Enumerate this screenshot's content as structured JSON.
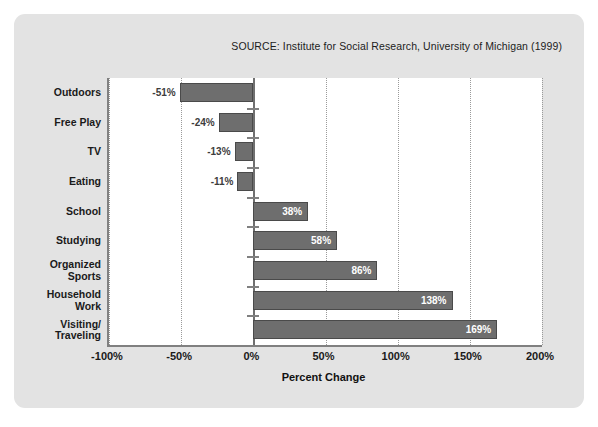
{
  "source_note": "SOURCE: Institute for Social Research, University of Michigan (1999)",
  "axis": {
    "xlabel": "Percent Change",
    "ticks": [
      "-100%",
      "-50%",
      "0%",
      "50%",
      "100%",
      "150%",
      "200%"
    ]
  },
  "colors": {
    "card_background": "#e3e3e3",
    "plot_background": "#ffffff",
    "bar_fill": "#6e6e6e",
    "bar_border": "#4a4a4a",
    "axis_line": "#808080",
    "gridline": "#9a9a9a",
    "text": "#1a1a1a",
    "inside_label": "#ffffff"
  },
  "chart_data": {
    "type": "bar",
    "orientation": "horizontal",
    "title": "",
    "xlabel": "Percent Change",
    "ylabel": "",
    "xlim": [
      -100,
      200
    ],
    "xticks": [
      -100,
      -50,
      0,
      50,
      100,
      150,
      200
    ],
    "grid": "vertical-dotted",
    "legend": "none",
    "categories": [
      "Outdoors",
      "Free Play",
      "TV",
      "Eating",
      "School",
      "Studying",
      "Organized Sports",
      "Household Work",
      "Visiting/ Traveling"
    ],
    "values": [
      -51,
      -24,
      -13,
      -11,
      38,
      58,
      86,
      138,
      169
    ],
    "value_labels": [
      "-51%",
      "-24%",
      "-13%",
      "-11%",
      "38%",
      "58%",
      "86%",
      "138%",
      "169%"
    ],
    "annotations": [
      "SOURCE: Institute for Social Research, University of Michigan (1999)"
    ]
  },
  "category_lines": [
    [
      "Outdoors"
    ],
    [
      "Free Play"
    ],
    [
      "TV"
    ],
    [
      "Eating"
    ],
    [
      "School"
    ],
    [
      "Studying"
    ],
    [
      "Organized",
      "Sports"
    ],
    [
      "Household",
      "Work"
    ],
    [
      "Visiting/",
      "Traveling"
    ]
  ]
}
